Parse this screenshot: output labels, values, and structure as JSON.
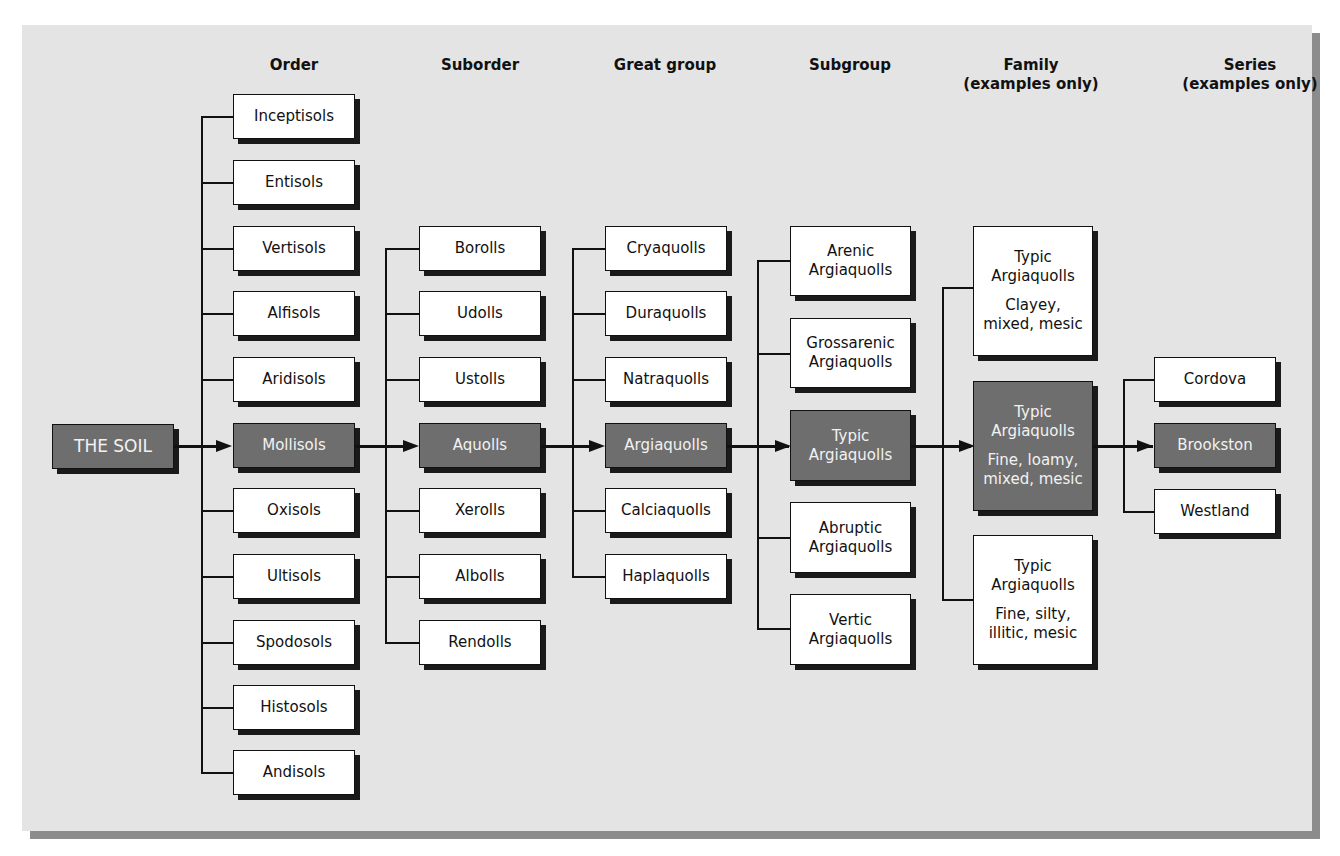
{
  "diagram": {
    "type": "hierarchy",
    "levels": [
      "Order",
      "Suborder",
      "Great group",
      "Subgroup",
      "Family",
      "Series"
    ]
  },
  "headers": {
    "order": "Order",
    "suborder": "Suborder",
    "great_group": "Great group",
    "subgroup": "Subgroup",
    "family_line1": "Family",
    "family_line2": "(examples only)",
    "series_line1": "Series",
    "series_line2": "(examples only)"
  },
  "root": {
    "label": "THE SOIL"
  },
  "orders": [
    "Inceptisols",
    "Entisols",
    "Vertisols",
    "Alfisols",
    "Aridisols",
    "Mollisols",
    "Oxisols",
    "Ultisols",
    "Spodosols",
    "Histosols",
    "Andisols"
  ],
  "suborders": [
    "Borolls",
    "Udolls",
    "Ustolls",
    "Aquolls",
    "Xerolls",
    "Albolls",
    "Rendolls"
  ],
  "great_groups": [
    "Cryaquolls",
    "Duraquolls",
    "Natraquolls",
    "Argiaquolls",
    "Calciaquolls",
    "Haplaquolls"
  ],
  "subgroups": [
    {
      "line1": "Arenic",
      "line2": "Argiaquolls"
    },
    {
      "line1": "Grossarenic",
      "line2": "Argiaquolls"
    },
    {
      "line1": "Typic",
      "line2": "Argiaquolls"
    },
    {
      "line1": "Abruptic",
      "line2": "Argiaquolls"
    },
    {
      "line1": "Vertic",
      "line2": "Argiaquolls"
    }
  ],
  "families": [
    {
      "line1": "Typic",
      "line2": "Argiaquolls",
      "line3": "Clayey,",
      "line4": "mixed, mesic"
    },
    {
      "line1": "Typic",
      "line2": "Argiaquolls",
      "line3": "Fine, loamy,",
      "line4": "mixed, mesic"
    },
    {
      "line1": "Typic",
      "line2": "Argiaquolls",
      "line3": "Fine, silty,",
      "line4": "illitic, mesic"
    }
  ],
  "series": [
    "Cordova",
    "Brookston",
    "Westland"
  ],
  "selected_path": [
    "THE SOIL",
    "Mollisols",
    "Aquolls",
    "Argiaquolls",
    "Typic Argiaquolls",
    "Typic Argiaquolls Fine, loamy, mixed, mesic",
    "Brookston"
  ],
  "colors": {
    "background": "#e4e4e4",
    "box_fill": "#ffffff",
    "selected_fill": "#6e6e6e",
    "line": "#111111"
  }
}
